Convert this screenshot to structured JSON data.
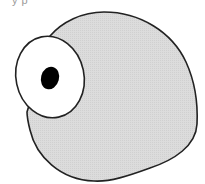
{
  "caption": {
    "text": "y p"
  },
  "illustration": {
    "description": "one-eyed blob creature",
    "colors": {
      "body_fill": "#dcdcdc",
      "outline": "#222222",
      "eye_white": "#ffffff",
      "pupil": "#000000",
      "background": "#ffffff"
    }
  }
}
